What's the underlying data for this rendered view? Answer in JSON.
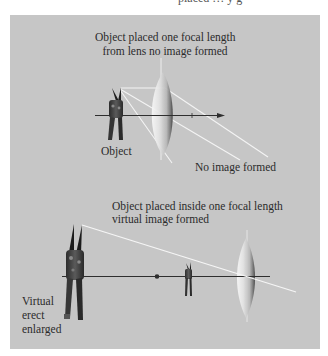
{
  "top_clipped_text": "placed … y g",
  "colors": {
    "panel_background": "#c6c6c6",
    "page_background": "#ffffff",
    "ray": "#f2f2f2",
    "axis": "#2e2e2e",
    "text": "#2b2b2b"
  },
  "diagram_top": {
    "title_line1": "Object placed one focal length",
    "title_line2": "from lens no image formed",
    "object_label": "Object",
    "result_label": "No image formed",
    "elements": [
      "optical-axis-with-arrow",
      "convex-lens",
      "vertical-lens-axis",
      "pliers-object",
      "diverging-rays-x3"
    ]
  },
  "diagram_bottom": {
    "title_line1": "Object placed inside one focal length",
    "title_line2": "virtual image formed",
    "image_label_line1": "Virtual",
    "image_label_line2": "erect",
    "image_label_line3": "enlarged",
    "elements": [
      "optical-axis",
      "focal-point-dot",
      "small-pliers-object",
      "convex-lens",
      "enlarged-virtual-pliers-image",
      "ray-line"
    ]
  }
}
